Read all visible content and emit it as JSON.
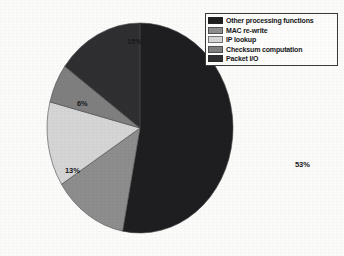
{
  "chart_data": {
    "type": "pie",
    "title": "",
    "subtitle": "",
    "xlabel": "",
    "ylabel": "",
    "legend_position": "top-right",
    "grid": false,
    "start_angle_deg": 0,
    "direction": "clockwise",
    "categories": [
      "Other processing functions",
      "MAC re-write",
      "IP lookup",
      "Checksum computation",
      "Packet I/O"
    ],
    "values": [
      53,
      13,
      13,
      6,
      15
    ],
    "value_unit": "%",
    "data_labels": [
      "53%",
      "13%",
      "13%",
      "6%",
      "15%"
    ],
    "colors": [
      "#1e1e20",
      "#8d8d8d",
      "#d5d5d5",
      "#7f7f7f",
      "#2f2f31"
    ],
    "slices": [
      {
        "label": "Other processing functions",
        "value": 53,
        "data_label": "53%",
        "color": "#1e1e20"
      },
      {
        "label": "MAC re-write",
        "value": 13,
        "data_label": "13%",
        "color": "#8d8d8d"
      },
      {
        "label": "IP lookup",
        "value": 13,
        "data_label": "13%",
        "color": "#d5d5d5"
      },
      {
        "label": "Checksum computation",
        "value": 6,
        "data_label": "6%",
        "color": "#7f7f7f"
      },
      {
        "label": "Packet I/O",
        "value": 15,
        "data_label": "15%",
        "color": "#2f2f31"
      }
    ]
  },
  "legend": {
    "items": [
      {
        "label": "Other processing functions",
        "color": "#1e1e20"
      },
      {
        "label": "MAC re-write",
        "color": "#8d8d8d"
      },
      {
        "label": "IP lookup",
        "color": "#d5d5d5"
      },
      {
        "label": "Checksum computation",
        "color": "#7f7f7f"
      },
      {
        "label": "Packet I/O",
        "color": "#2f2f31"
      }
    ]
  },
  "labels": {
    "other": "53%",
    "mac": "13%",
    "iplookup": "13%",
    "checksum": "6%",
    "packetio": "15%"
  }
}
